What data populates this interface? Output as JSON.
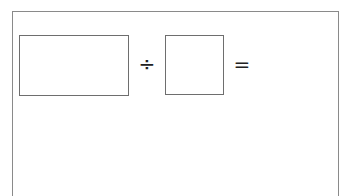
{
  "worksheet": {
    "problem": {
      "dividend_value": "",
      "divide_symbol": "÷",
      "divisor_value": "",
      "equals_symbol": "=",
      "result_value": ""
    }
  }
}
